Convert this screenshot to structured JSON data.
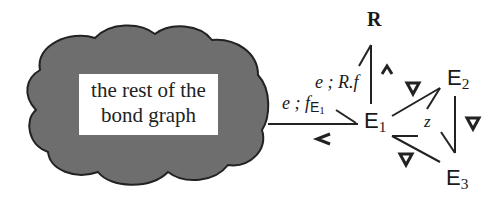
{
  "cloud": {
    "line1": "the rest of the",
    "line2": "bond graph",
    "fill_color": "#6e6e6e"
  },
  "nodes": {
    "R": "R",
    "E1": "E",
    "E1_sub": "1",
    "E2": "E",
    "E2_sub": "2",
    "E3": "E",
    "E3_sub": "3"
  },
  "edge_labels": {
    "cloud_E1_prefix": "e ; f",
    "cloud_E1_sub": "E",
    "cloud_E1_subsub": "1",
    "E1_R": "e ; R.f",
    "E1_E2_z": "z"
  },
  "causal_marks": {
    "cloud_E1": "<",
    "E1_R": "^",
    "E1_E2": "▽",
    "E2_E3": "▽",
    "E1_E3": "▽"
  }
}
